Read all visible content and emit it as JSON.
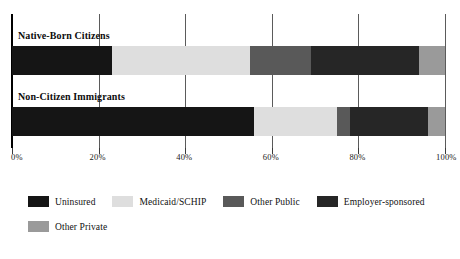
{
  "chart_data": {
    "type": "bar",
    "orientation": "horizontal",
    "stacked": true,
    "stack_total": 100,
    "title": "",
    "subtitle": "",
    "xlabel": "",
    "ylabel": "",
    "xlim": [
      0,
      100
    ],
    "xticks": [
      0,
      20,
      40,
      60,
      80,
      100
    ],
    "xticklabels": [
      "0%",
      "20%",
      "40%",
      "60%",
      "80%",
      "100%"
    ],
    "grid": true,
    "grid_axis": "x",
    "legend_position": "bottom-left",
    "categories": [
      "Native-Born Citizens",
      "Non-Citizen Immigrants"
    ],
    "series": [
      {
        "name": "Uninsured",
        "color": "#151515",
        "values": [
          23,
          56
        ]
      },
      {
        "name": "Medicaid/SCHIP",
        "color": "#dedede",
        "values": [
          32,
          19
        ]
      },
      {
        "name": "Other Public",
        "color": "#595959",
        "values": [
          14,
          3
        ]
      },
      {
        "name": "Employer-sponsored",
        "color": "#262626",
        "values": [
          25,
          18
        ]
      },
      {
        "name": "Other Private",
        "color": "#9a9a9a",
        "values": [
          6,
          4
        ]
      }
    ]
  },
  "axis": {
    "ticks": [
      {
        "label": "0%",
        "value": 0
      },
      {
        "label": "20%",
        "value": 20
      },
      {
        "label": "40%",
        "value": 40
      },
      {
        "label": "60%",
        "value": 60
      },
      {
        "label": "80%",
        "value": 80
      },
      {
        "label": "100%",
        "value": 100
      }
    ]
  },
  "groups": [
    {
      "label": "Native-Born Citizens"
    },
    {
      "label": "Non-Citizen Immigrants"
    }
  ],
  "legend": {
    "items": [
      {
        "label": "Uninsured",
        "color": "#151515"
      },
      {
        "label": "Medicaid/SCHIP",
        "color": "#dedede"
      },
      {
        "label": "Other Public",
        "color": "#595959"
      },
      {
        "label": "Employer-sponsored",
        "color": "#262626"
      },
      {
        "label": "Other Private",
        "color": "#9a9a9a"
      }
    ]
  },
  "colors": {
    "uninsured": "#151515",
    "medicaid_schip": "#dedede",
    "other_public": "#595959",
    "employer_sponsored": "#262626",
    "other_private": "#9a9a9a",
    "axis": "#000000",
    "gridline": "#5b5b5b",
    "background": "#ffffff"
  }
}
